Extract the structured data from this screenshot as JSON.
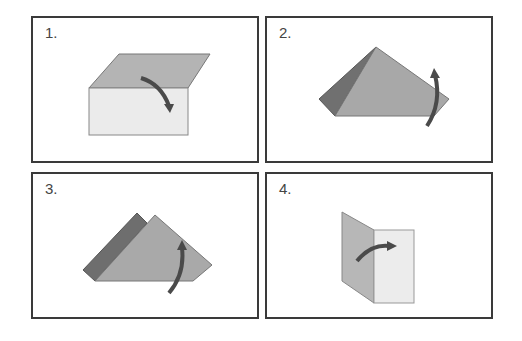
{
  "panels": [
    {
      "label": "1.",
      "description": "Box with top flap folding down over front"
    },
    {
      "label": "2.",
      "description": "Triangular fold with corner folding up"
    },
    {
      "label": "3.",
      "description": "Folded triangle with corner folding up"
    },
    {
      "label": "4.",
      "description": "Vertical panel folding right"
    }
  ],
  "colors": {
    "border": "#3a3a3a",
    "light_face": "#e6e6e6",
    "mid_face": "#a9a9a9",
    "dark_face": "#6e6e6e",
    "arrow": "#4a4a4a"
  }
}
